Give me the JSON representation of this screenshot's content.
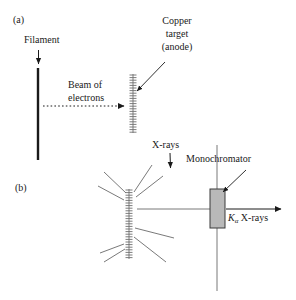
{
  "figure": {
    "type": "scientific-diagram",
    "title_visible": false,
    "panels": [
      {
        "id": "a",
        "label": "(a)"
      },
      {
        "id": "b",
        "label": "(b)"
      }
    ],
    "colors": {
      "ink": "#1a1a1a",
      "line": "#555555",
      "crystal_fill": "#b9b9b9",
      "crystal_stroke": "#3a3a3a",
      "background": "#ffffff"
    }
  },
  "panel_a": {
    "panel_label": "(a)",
    "labels": {
      "filament": "Filament",
      "beam_line1": "Beam of",
      "beam_line2": "electrons",
      "target_line1": "Copper",
      "target_line2": "target",
      "target_line3": "(anode)"
    },
    "elements": {
      "filament_name": "filament-bar",
      "target_name": "copper-target-anode",
      "beam_name": "electron-beam-dotted-arrow"
    }
  },
  "panel_b": {
    "panel_label": "(b)",
    "labels": {
      "xrays": "X-rays",
      "monochromator": "Monochromator",
      "output_k": "K",
      "output_sub": "α",
      "output_rest": " X-rays"
    },
    "elements": {
      "target_name": "copper-target-anode",
      "crystal_name": "monochromator-crystal",
      "output_beam_name": "k-alpha-output-beam"
    }
  }
}
